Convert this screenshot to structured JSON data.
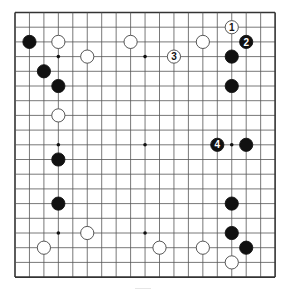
{
  "board": {
    "size": 19,
    "origin": {
      "x": 15,
      "y": 12.5
    },
    "spacing": {
      "x": 14.45,
      "y": 14.7
    },
    "line_color": "#555555",
    "border_color": "#333333",
    "star_points": [
      [
        3,
        3
      ],
      [
        9,
        3
      ],
      [
        15,
        3
      ],
      [
        3,
        9
      ],
      [
        9,
        9
      ],
      [
        15,
        9
      ],
      [
        3,
        15
      ],
      [
        9,
        15
      ],
      [
        15,
        15
      ]
    ],
    "stone_radius": 6.6
  },
  "stones": [
    {
      "color": "black",
      "col": 1,
      "row": 2
    },
    {
      "color": "white",
      "col": 3,
      "row": 2
    },
    {
      "color": "white",
      "col": 8,
      "row": 2
    },
    {
      "color": "white",
      "col": 5,
      "row": 3
    },
    {
      "color": "black",
      "col": 2,
      "row": 4
    },
    {
      "color": "black",
      "col": 3,
      "row": 5
    },
    {
      "color": "white",
      "col": 3,
      "row": 7
    },
    {
      "color": "black",
      "col": 3,
      "row": 10
    },
    {
      "color": "black",
      "col": 3,
      "row": 13
    },
    {
      "color": "white",
      "col": 5,
      "row": 15
    },
    {
      "color": "white",
      "col": 2,
      "row": 16
    },
    {
      "color": "white",
      "col": 10,
      "row": 16
    },
    {
      "color": "white",
      "col": 13,
      "row": 2
    },
    {
      "color": "black",
      "col": 15,
      "row": 3
    },
    {
      "color": "black",
      "col": 15,
      "row": 5
    },
    {
      "color": "black",
      "col": 16,
      "row": 9
    },
    {
      "color": "black",
      "col": 15,
      "row": 13
    },
    {
      "color": "black",
      "col": 15,
      "row": 15
    },
    {
      "color": "black",
      "col": 16,
      "row": 16
    },
    {
      "color": "white",
      "col": 13,
      "row": 16
    },
    {
      "color": "white",
      "col": 15,
      "row": 17
    }
  ],
  "numbered_moves": [
    {
      "number": "1",
      "color": "white",
      "col": 15,
      "row": 1
    },
    {
      "number": "2",
      "color": "black",
      "col": 16,
      "row": 2
    },
    {
      "number": "3",
      "color": "white",
      "col": 11,
      "row": 3
    },
    {
      "number": "4",
      "color": "black",
      "col": 14,
      "row": 9
    }
  ]
}
